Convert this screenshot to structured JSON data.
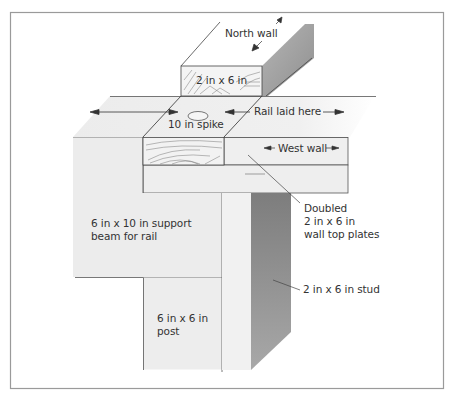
{
  "figure": {
    "type": "isometric construction diagram"
  },
  "labels": {
    "north_wall": "North wall",
    "board_2x6": "2 in x 6 in",
    "spike": "10 in spike",
    "rail_laid_here": "Rail laid here",
    "west_wall": "West wall",
    "doubled_plates": [
      "Doubled",
      "2 in x 6 in",
      "wall top plates"
    ],
    "support_beam": [
      "6 in x 10 in support",
      "beam for rail"
    ],
    "stud": "2 in x 6 in stud",
    "post": [
      "6 in x 6 in",
      "post"
    ]
  },
  "colors": {
    "frame": "#9a9a9a",
    "line": "#4a4a4a",
    "light_face": "#efefef",
    "mid_face": "#e2e2e2",
    "dark_face": "#8c8c8c",
    "text": "#333333"
  }
}
